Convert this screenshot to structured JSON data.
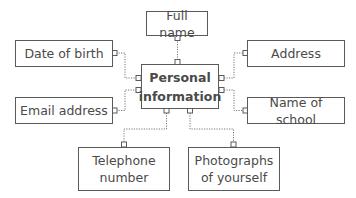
{
  "diagram": {
    "type": "mind-map",
    "center": {
      "line1": "Personal",
      "line2": "information"
    },
    "nodes": {
      "full_name": {
        "label": "Full name"
      },
      "date_of_birth": {
        "label": "Date of birth"
      },
      "address": {
        "label": "Address"
      },
      "email_address": {
        "label": "Email address"
      },
      "name_of_school": {
        "label": "Name of school"
      },
      "telephone": {
        "line1": "Telephone",
        "line2": "number"
      },
      "photographs": {
        "line1": "Photographs",
        "line2": "of yourself"
      }
    },
    "edges": [
      [
        "Personal information",
        "Full name"
      ],
      [
        "Personal information",
        "Date of birth"
      ],
      [
        "Personal information",
        "Address"
      ],
      [
        "Personal information",
        "Email address"
      ],
      [
        "Personal information",
        "Name of school"
      ],
      [
        "Personal information",
        "Telephone number"
      ],
      [
        "Personal information",
        "Photographs of yourself"
      ]
    ],
    "colors": {
      "border": "#5a5a5a",
      "text": "#4a4a4a",
      "connector": "#777777"
    }
  }
}
